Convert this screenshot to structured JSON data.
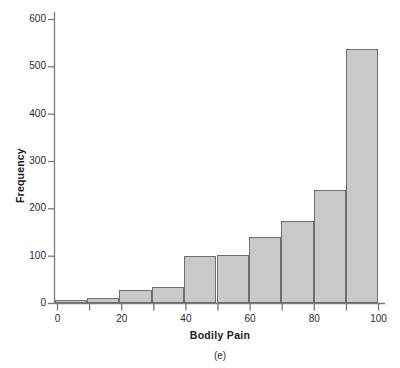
{
  "chart_data": {
    "type": "bar",
    "title": "",
    "subtitle": "",
    "xlabel": "Bodily Pain",
    "ylabel": "Frequency",
    "panel_label": "(e)",
    "grid": false,
    "legend": null,
    "xlim": [
      0,
      100
    ],
    "ylim": [
      0,
      630
    ],
    "xticks": [
      0,
      20,
      40,
      60,
      80,
      100
    ],
    "xtick_labels": [
      "0",
      "20",
      "40",
      "60",
      "80",
      "100"
    ],
    "xminor_ticks": [
      10,
      30,
      50,
      70,
      90
    ],
    "yticks": [
      0,
      100,
      200,
      300,
      400,
      500,
      600
    ],
    "ytick_labels": [
      "0",
      "100",
      "200",
      "300",
      "400",
      "500",
      "600"
    ],
    "bin_edges": [
      0,
      10,
      20,
      30,
      40,
      50,
      60,
      70,
      80,
      90,
      100
    ],
    "categories": [
      "0-10",
      "10-20",
      "20-30",
      "30-40",
      "40-50",
      "50-60",
      "60-70",
      "70-80",
      "80-90",
      "90-100"
    ],
    "values": [
      7,
      12,
      28,
      34,
      100,
      103,
      140,
      175,
      241,
      537
    ],
    "bar_fill_color": "#c9c9c9",
    "bar_edge_color": "#6e6e6e",
    "axis_color": "#7a7a7a",
    "text_color": "#2b2b2b"
  }
}
